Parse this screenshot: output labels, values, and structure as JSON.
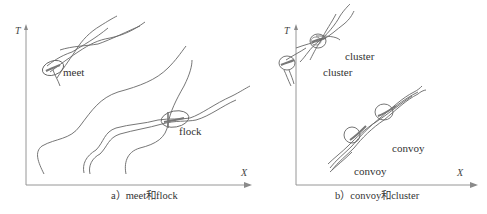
{
  "panel_a": {
    "axis_y_label": "T",
    "axis_x_label": "X",
    "labels": {
      "meet": "meet",
      "flock": "flock"
    },
    "caption": "a）meet和flock"
  },
  "panel_b": {
    "axis_y_label": "T",
    "axis_x_label": "X",
    "labels": {
      "cluster_top": "cluster",
      "cluster_bottom": "cluster",
      "convoy_top": "convoy",
      "convoy_bottom": "convoy"
    },
    "caption": "b）convoy和cluster"
  },
  "colors": {
    "stroke": "#555555",
    "axis": "#888888",
    "text": "#333333"
  }
}
